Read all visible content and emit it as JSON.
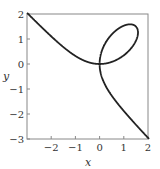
{
  "chart_data": {
    "type": "line",
    "title": "",
    "xlabel": "x",
    "ylabel": "y",
    "xlim": [
      -3,
      2
    ],
    "ylim": [
      -3,
      2
    ],
    "xticks": [
      -2,
      -1,
      0,
      1,
      2
    ],
    "xtick_labels": [
      "−2",
      "−1",
      "0",
      "1",
      "2"
    ],
    "yticks": [
      -3,
      -2,
      -1,
      0,
      1,
      2
    ],
    "ytick_labels": [
      "−3",
      "−2",
      "−1",
      "0",
      "1",
      "2"
    ],
    "grid": false,
    "legend": null,
    "series": [
      {
        "name": "folium",
        "equation": "x^3 + y^3 = 3xy",
        "color": "#222222",
        "key_points": [
          {
            "x": -3,
            "y": 2
          },
          {
            "x": 0,
            "y": 0
          },
          {
            "x": 1.5,
            "y": 1.5
          },
          {
            "x": 2,
            "y": -3
          }
        ]
      }
    ]
  },
  "plot": {
    "frame_color": "#888888",
    "curve_color": "#222222"
  }
}
